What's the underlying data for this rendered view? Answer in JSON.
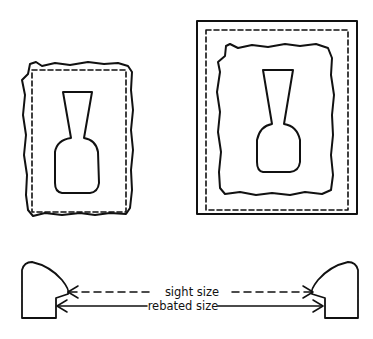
{
  "figure": {
    "colors": {
      "ink": "#111111",
      "background": "#ffffff"
    }
  },
  "cross_section": {
    "sight_size_label": "sight size",
    "rebated_size_label": "rebated size"
  }
}
